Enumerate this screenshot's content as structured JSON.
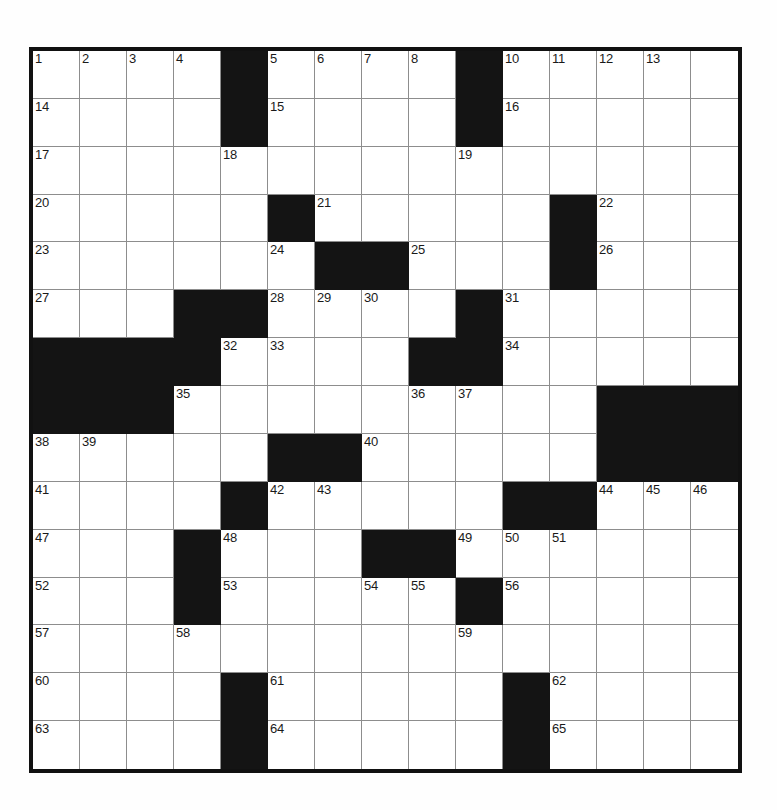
{
  "puzzle": {
    "kind": "crossword-grid",
    "rows": 15,
    "cols": 15,
    "background_color": "#ffffff",
    "block_color": "#141414",
    "gridline_color": "#8d8d8d",
    "border_color": "#111111",
    "number_color": "#1a1a1a",
    "blocks": [
      [
        1,
        5
      ],
      [
        1,
        10
      ],
      [
        2,
        5
      ],
      [
        2,
        10
      ],
      [
        4,
        6
      ],
      [
        4,
        12
      ],
      [
        5,
        7
      ],
      [
        5,
        8
      ],
      [
        5,
        12
      ],
      [
        6,
        4
      ],
      [
        6,
        5
      ],
      [
        6,
        10
      ],
      [
        7,
        1
      ],
      [
        7,
        2
      ],
      [
        7,
        3
      ],
      [
        7,
        4
      ],
      [
        7,
        9
      ],
      [
        7,
        10
      ],
      [
        8,
        1
      ],
      [
        8,
        2
      ],
      [
        8,
        3
      ],
      [
        8,
        13
      ],
      [
        8,
        14
      ],
      [
        8,
        15
      ],
      [
        9,
        6
      ],
      [
        9,
        7
      ],
      [
        9,
        13
      ],
      [
        9,
        14
      ],
      [
        9,
        15
      ],
      [
        10,
        5
      ],
      [
        10,
        11
      ],
      [
        10,
        12
      ],
      [
        11,
        4
      ],
      [
        11,
        8
      ],
      [
        11,
        9
      ],
      [
        12,
        4
      ],
      [
        12,
        10
      ],
      [
        14,
        5
      ],
      [
        14,
        11
      ],
      [
        15,
        5
      ],
      [
        15,
        11
      ]
    ],
    "numbers": [
      {
        "row": 1,
        "col": 1,
        "n": "1"
      },
      {
        "row": 1,
        "col": 2,
        "n": "2"
      },
      {
        "row": 1,
        "col": 3,
        "n": "3"
      },
      {
        "row": 1,
        "col": 4,
        "n": "4"
      },
      {
        "row": 1,
        "col": 6,
        "n": "5"
      },
      {
        "row": 1,
        "col": 7,
        "n": "6"
      },
      {
        "row": 1,
        "col": 8,
        "n": "7"
      },
      {
        "row": 1,
        "col": 9,
        "n": "8"
      },
      {
        "row": 1,
        "col": 10,
        "n": "9"
      },
      {
        "row": 1,
        "col": 11,
        "n": "10"
      },
      {
        "row": 1,
        "col": 12,
        "n": "11"
      },
      {
        "row": 1,
        "col": 13,
        "n": "12"
      },
      {
        "row": 1,
        "col": 14,
        "n": "13"
      },
      {
        "row": 2,
        "col": 1,
        "n": "14"
      },
      {
        "row": 2,
        "col": 6,
        "n": "15"
      },
      {
        "row": 2,
        "col": 11,
        "n": "16"
      },
      {
        "row": 3,
        "col": 1,
        "n": "17"
      },
      {
        "row": 3,
        "col": 5,
        "n": "18"
      },
      {
        "row": 3,
        "col": 10,
        "n": "19"
      },
      {
        "row": 4,
        "col": 1,
        "n": "20"
      },
      {
        "row": 4,
        "col": 7,
        "n": "21"
      },
      {
        "row": 4,
        "col": 13,
        "n": "22"
      },
      {
        "row": 5,
        "col": 1,
        "n": "23"
      },
      {
        "row": 5,
        "col": 6,
        "n": "24"
      },
      {
        "row": 5,
        "col": 9,
        "n": "25"
      },
      {
        "row": 5,
        "col": 13,
        "n": "26"
      },
      {
        "row": 6,
        "col": 1,
        "n": "27"
      },
      {
        "row": 6,
        "col": 6,
        "n": "28"
      },
      {
        "row": 6,
        "col": 7,
        "n": "29"
      },
      {
        "row": 6,
        "col": 8,
        "n": "30"
      },
      {
        "row": 6,
        "col": 11,
        "n": "31"
      },
      {
        "row": 7,
        "col": 5,
        "n": "32"
      },
      {
        "row": 7,
        "col": 6,
        "n": "33"
      },
      {
        "row": 7,
        "col": 11,
        "n": "34"
      },
      {
        "row": 8,
        "col": 4,
        "n": "35"
      },
      {
        "row": 8,
        "col": 9,
        "n": "36"
      },
      {
        "row": 8,
        "col": 10,
        "n": "37"
      },
      {
        "row": 9,
        "col": 1,
        "n": "38"
      },
      {
        "row": 9,
        "col": 2,
        "n": "39"
      },
      {
        "row": 9,
        "col": 8,
        "n": "40"
      },
      {
        "row": 10,
        "col": 1,
        "n": "41"
      },
      {
        "row": 10,
        "col": 6,
        "n": "42"
      },
      {
        "row": 10,
        "col": 7,
        "n": "43"
      },
      {
        "row": 10,
        "col": 13,
        "n": "44"
      },
      {
        "row": 10,
        "col": 14,
        "n": "45"
      },
      {
        "row": 10,
        "col": 15,
        "n": "46"
      },
      {
        "row": 11,
        "col": 1,
        "n": "47"
      },
      {
        "row": 11,
        "col": 5,
        "n": "48"
      },
      {
        "row": 11,
        "col": 10,
        "n": "49"
      },
      {
        "row": 11,
        "col": 11,
        "n": "50"
      },
      {
        "row": 11,
        "col": 12,
        "n": "51"
      },
      {
        "row": 12,
        "col": 1,
        "n": "52"
      },
      {
        "row": 12,
        "col": 5,
        "n": "53"
      },
      {
        "row": 12,
        "col": 8,
        "n": "54"
      },
      {
        "row": 12,
        "col": 9,
        "n": "55"
      },
      {
        "row": 12,
        "col": 11,
        "n": "56"
      },
      {
        "row": 13,
        "col": 1,
        "n": "57"
      },
      {
        "row": 13,
        "col": 4,
        "n": "58"
      },
      {
        "row": 13,
        "col": 10,
        "n": "59"
      },
      {
        "row": 14,
        "col": 1,
        "n": "60"
      },
      {
        "row": 14,
        "col": 6,
        "n": "61"
      },
      {
        "row": 14,
        "col": 12,
        "n": "62"
      },
      {
        "row": 15,
        "col": 1,
        "n": "63"
      },
      {
        "row": 15,
        "col": 6,
        "n": "64"
      },
      {
        "row": 15,
        "col": 12,
        "n": "65"
      }
    ],
    "letters": []
  }
}
